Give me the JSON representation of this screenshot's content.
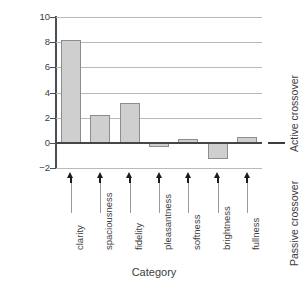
{
  "chart_data": {
    "type": "bar",
    "title": "",
    "xlabel": "Category",
    "ylabel": "Comparison",
    "categories": [
      "clarity",
      "spaciousness",
      "fidelity",
      "pleasantness",
      "softness",
      "brightness",
      "fullness"
    ],
    "values": [
      8.2,
      2.2,
      3.15,
      -0.35,
      0.3,
      -1.3,
      0.45
    ],
    "ylim": [
      -2,
      10
    ],
    "yticks": [
      -2,
      0,
      2,
      4,
      6,
      8,
      10
    ],
    "ytick_labels": [
      "−2",
      "0",
      "2",
      "4",
      "6",
      "8",
      "10"
    ],
    "grid": true,
    "grid_axis": "y",
    "legend": "none",
    "zero_reference_line": 0,
    "annotations": [
      {
        "text": "Active crossover",
        "position": "right",
        "region": "above-zero"
      },
      {
        "text": "Passive crossover",
        "position": "right",
        "region": "below-zero"
      }
    ],
    "marker_style": "up-arrow-with-leader-line",
    "bar_fill_color": "#cfcfcf",
    "bar_edge_color": "#8d8d8d",
    "axis_color": "#4a4d51",
    "grid_color": "#b9b9b9"
  },
  "axes": {
    "y_title": "Comparison",
    "x_title": "Category"
  },
  "side_labels": {
    "active": "Active crossover",
    "passive": "Passive crossover"
  }
}
